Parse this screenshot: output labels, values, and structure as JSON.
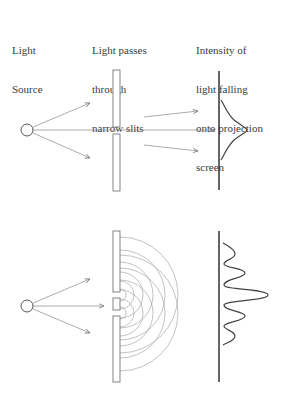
{
  "labels": {
    "source": [
      "Light",
      "Source"
    ],
    "slits": [
      "Light passes",
      "through",
      "narrow slits"
    ],
    "screen": [
      "Intensity of",
      "light falling",
      "onto projection",
      "screen"
    ]
  },
  "diagram": {
    "upper_panel": {
      "description": "Light treated as particles: passes through two slits, producing a single intensity peak on screen",
      "intensity_pattern": "single peak"
    },
    "lower_panel": {
      "description": "Light treated as waves: circular wavefronts from two slits interfere, producing multiple intensity fringes on screen",
      "intensity_pattern": "interference fringes (5 peaks, central maximum largest)"
    },
    "colors": {
      "stroke": "#555555",
      "thin_stroke": "#888888",
      "screen": "#333333"
    }
  }
}
